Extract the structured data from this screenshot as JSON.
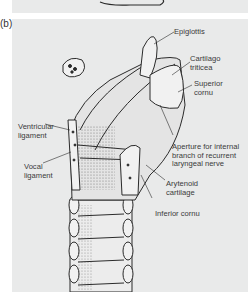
{
  "panel_letter": "(b)",
  "figure": {
    "labels": {
      "epiglottis": "Epiglottis",
      "cartilago_triticea": "Cartilago\ntriticea",
      "superior_cornu": "Superior\ncornu",
      "aperture": "Aperture for internal\nbranch of recurrent\nlaryngeal nerve",
      "arytenoid": "Arytenoid\ncartilage",
      "inferior_cornu": "Inferior cornu",
      "ventricular_ligament": "Ventricular\nligament",
      "vocal_ligament": "Vocal\nligament"
    }
  },
  "colors": {
    "panel_bg": "#e9eaea",
    "ink": "#2b2b2b",
    "label_text": "#3a3a3a"
  }
}
